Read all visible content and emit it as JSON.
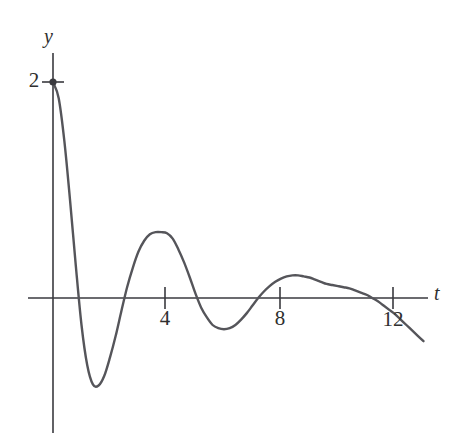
{
  "figure": {
    "background_color": "#ffffff",
    "stroke_color": "#55555a",
    "axis_color": "#3a3a3f"
  },
  "axes": {
    "y_axis_label": "y",
    "x_axis_label": "t"
  },
  "ticks": {
    "y": [
      {
        "value": 2,
        "label": "2",
        "pixel_x": 53,
        "pixel_y": 82
      }
    ],
    "x": [
      {
        "value": 4,
        "label": "4",
        "pixel_x": 165,
        "pixel_y": 298
      },
      {
        "value": 8,
        "label": "8",
        "pixel_x": 280,
        "pixel_y": 298
      },
      {
        "value": 12,
        "label": "12",
        "pixel_x": 393,
        "pixel_y": 298
      }
    ]
  },
  "marker": {
    "name": "initial-point",
    "t": 0,
    "y": 2
  },
  "chart_data": {
    "type": "line",
    "title": "",
    "subtitle": "",
    "xlabel": "t",
    "ylabel": "y",
    "xlim": [
      -0.2,
      13.2
    ],
    "ylim": [
      -1.1,
      2.15
    ],
    "grid": false,
    "legend": null,
    "xticks": [
      4,
      8,
      12
    ],
    "yticks": [
      2
    ],
    "series": [
      {
        "name": "damped-oscillation",
        "color": "#55555a",
        "x": [
          0.0,
          0.2,
          0.4,
          0.6,
          0.8,
          1.0,
          1.2,
          1.4,
          1.6,
          1.8,
          2.0,
          2.2,
          2.4,
          2.6,
          2.8,
          3.0,
          3.2,
          3.4,
          3.6,
          3.8,
          4.0,
          4.2,
          4.4,
          4.6,
          4.8,
          5.0,
          5.2,
          5.4,
          5.6,
          5.8,
          6.0,
          6.2,
          6.4,
          6.6,
          6.8,
          7.0,
          7.2,
          7.4,
          7.6,
          7.8,
          8.0,
          8.2,
          8.4,
          8.6,
          8.8,
          9.0,
          9.2,
          9.4,
          9.6,
          9.8,
          10.0,
          10.2,
          10.4,
          10.6,
          10.8,
          11.0,
          11.2,
          11.4,
          11.6,
          11.8,
          12.0,
          12.2,
          12.4,
          12.6,
          12.8,
          13.0
        ],
        "y": [
          2.0,
          1.85,
          1.45,
          0.9,
          0.3,
          -0.25,
          -0.62,
          -0.8,
          -0.81,
          -0.72,
          -0.55,
          -0.35,
          -0.12,
          0.1,
          0.28,
          0.43,
          0.53,
          0.59,
          0.61,
          0.61,
          0.6,
          0.55,
          0.45,
          0.33,
          0.19,
          0.04,
          -0.09,
          -0.18,
          -0.25,
          -0.28,
          -0.29,
          -0.28,
          -0.25,
          -0.2,
          -0.14,
          -0.07,
          0.0,
          0.06,
          0.11,
          0.15,
          0.18,
          0.2,
          0.21,
          0.21,
          0.2,
          0.19,
          0.17,
          0.15,
          0.13,
          0.12,
          0.11,
          0.1,
          0.09,
          0.07,
          0.05,
          0.03,
          0.0,
          -0.03,
          -0.07,
          -0.11,
          -0.15,
          -0.2,
          -0.25,
          -0.3,
          -0.35,
          -0.4
        ]
      }
    ],
    "key_points": {
      "start": {
        "t": 0,
        "y": 2
      },
      "minimum_1": {
        "t": 1.85,
        "y": -0.81
      },
      "maximum_1": {
        "t": 3.95,
        "y": 0.61
      },
      "minimum_2": {
        "t": 6.5,
        "y": -0.29
      },
      "maximum_2": {
        "t": 10.2,
        "y": 0.2
      },
      "zero_crossings": [
        0.94,
        2.8,
        5.5,
        8.3,
        11.9
      ]
    }
  }
}
